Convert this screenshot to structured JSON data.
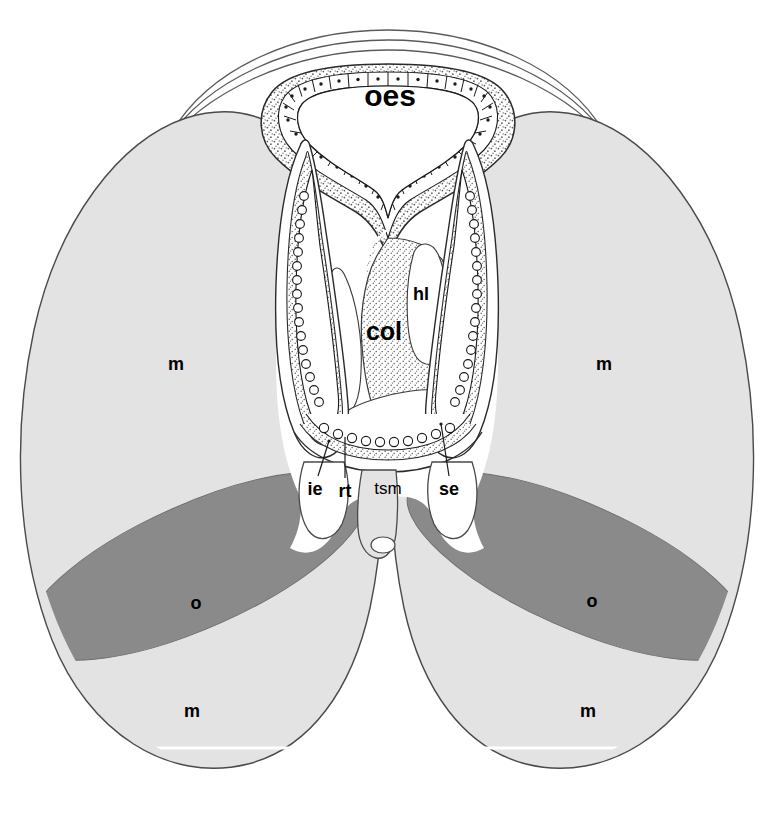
{
  "figure": {
    "type": "anatomical-cross-section",
    "background_color": "#ffffff",
    "palette": {
      "muscle_fill": "#e3e3e3",
      "ovary_fill": "#8a8a8a",
      "lumen_fill": "#ffffff",
      "stipple_fill": "#fbfbfb",
      "outline": "#4a4a4a",
      "dark_outline": "#1a1a1a",
      "scan_line": "#ffffff",
      "label_color": "#000000"
    },
    "labels": [
      {
        "id": "oes",
        "text": "oes",
        "x": 390,
        "y": 98,
        "size": "lbl-lg",
        "meaning": "oesophagus",
        "leader": false
      },
      {
        "id": "hl",
        "text": "hl",
        "x": 421,
        "y": 295,
        "size": "lbl-sm",
        "meaning": "haemocoelic lacuna",
        "leader": false
      },
      {
        "id": "col",
        "text": "col",
        "x": 384,
        "y": 333,
        "size": "lbl-md",
        "meaning": "collar / columella",
        "leader": false
      },
      {
        "id": "m-left-upper",
        "text": "m",
        "x": 176,
        "y": 365,
        "size": "lbl-sm",
        "meaning": "muscle",
        "leader": false
      },
      {
        "id": "m-right-upper",
        "text": "m",
        "x": 604,
        "y": 365,
        "size": "lbl-sm",
        "meaning": "muscle",
        "leader": false
      },
      {
        "id": "o-left",
        "text": "o",
        "x": 196,
        "y": 604,
        "size": "lbl-sm",
        "meaning": "ovary",
        "leader": false
      },
      {
        "id": "o-right",
        "text": "o",
        "x": 592,
        "y": 602,
        "size": "lbl-sm",
        "meaning": "ovary",
        "leader": false
      },
      {
        "id": "m-left-lower",
        "text": "m",
        "x": 192,
        "y": 712,
        "size": "lbl-sm",
        "meaning": "muscle",
        "leader": false
      },
      {
        "id": "m-right-lower",
        "text": "m",
        "x": 588,
        "y": 712,
        "size": "lbl-sm",
        "meaning": "muscle",
        "leader": false
      },
      {
        "id": "ie",
        "text": "ie",
        "x": 315,
        "y": 490,
        "size": "lbl-sm",
        "meaning": "inner epithelium",
        "leader": true
      },
      {
        "id": "rt",
        "text": "rt",
        "x": 345,
        "y": 492,
        "size": "lbl-sm",
        "meaning": "radular teeth",
        "leader": true
      },
      {
        "id": "tsm",
        "text": "tsm",
        "x": 388,
        "y": 490,
        "size": "lbl-xs",
        "meaning": "transverse subradular muscle",
        "leader": false
      },
      {
        "id": "se",
        "text": "se",
        "x": 449,
        "y": 490,
        "size": "lbl-sm",
        "meaning": "subradular epithelium",
        "leader": true
      }
    ],
    "leader_lines": [
      {
        "id": "leader-ie",
        "from_x": 318,
        "from_y": 476,
        "to_x": 329,
        "to_y": 441
      },
      {
        "id": "leader-rt",
        "from_x": 345,
        "from_y": 478,
        "to_x": 345,
        "to_y": 437
      },
      {
        "id": "leader-se",
        "from_x": 449,
        "from_y": 476,
        "to_x": 441,
        "to_y": 424
      }
    ],
    "regions": [
      {
        "id": "body-outline",
        "name": "body-wall-outline",
        "fill": "#ffffff"
      },
      {
        "id": "left-muscle-mass",
        "name": "left-muscle-mass",
        "fill": "#e3e3e3"
      },
      {
        "id": "right-muscle-mass",
        "name": "right-muscle-mass",
        "fill": "#e3e3e3"
      },
      {
        "id": "left-ovary",
        "name": "left-ovary",
        "fill": "#8a8a8a"
      },
      {
        "id": "right-ovary",
        "name": "right-ovary",
        "fill": "#8a8a8a"
      },
      {
        "id": "oesophagus-lumen",
        "name": "oesophagus-lumen",
        "fill": "#ffffff"
      },
      {
        "id": "columella-mass",
        "name": "columella-stippled-mass",
        "fill": "#fbfbfb"
      },
      {
        "id": "left-radular-sac",
        "name": "left-radular-sac",
        "fill": "#ffffff"
      },
      {
        "id": "right-radular-sac",
        "name": "right-radular-sac",
        "fill": "#ffffff"
      },
      {
        "id": "scan-line",
        "name": "horizontal-scan-artifact",
        "fill": "#ffffff"
      }
    ]
  }
}
